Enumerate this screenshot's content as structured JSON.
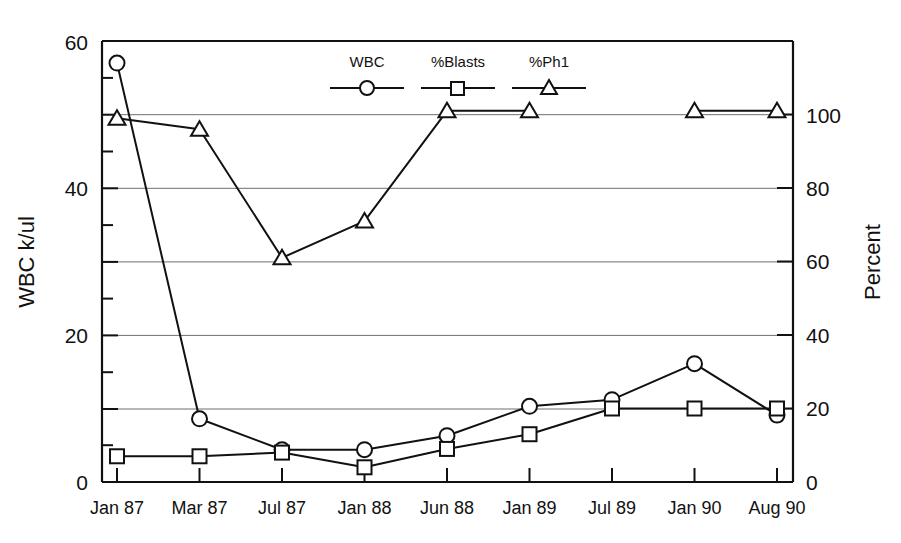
{
  "chart_data": {
    "type": "line",
    "title": "",
    "xlabel": "",
    "ylabel": "WBC k/ul",
    "y2label": "Percent",
    "categories": [
      "Jan 87",
      "Mar 87",
      "Jul 87",
      "Jan 88",
      "Jun 88",
      "Jan 89",
      "Jul 89",
      "Jan 90",
      "Aug 90"
    ],
    "ylim": [
      0,
      60
    ],
    "yticks": [
      0,
      20,
      40,
      60
    ],
    "yticks_minor": [
      10,
      30,
      50
    ],
    "y2lim": [
      0,
      120
    ],
    "y2ticks": [
      0,
      20,
      40,
      60,
      80,
      100
    ],
    "grid": true,
    "gridlines_at": [
      10,
      20,
      30,
      40,
      50
    ],
    "legend_position": "top-center-inside",
    "series": [
      {
        "name": "WBC",
        "marker": "circle",
        "axis": "left",
        "units": "k/ul",
        "values": [
          57,
          8.6,
          4.4,
          4.4,
          6.3,
          10.3,
          11.2,
          16.1,
          9.1
        ]
      },
      {
        "name": "%Blasts",
        "marker": "square",
        "axis": "right",
        "units": "percent",
        "values": [
          7,
          7,
          8,
          4,
          9,
          13,
          20,
          20,
          20
        ]
      },
      {
        "name": "%Ph1",
        "marker": "triangle",
        "axis": "right",
        "units": "percent",
        "values": [
          99,
          96,
          61,
          71,
          101,
          101,
          null,
          101,
          101
        ]
      }
    ]
  },
  "axes": {
    "left": {
      "title": "WBC k/ul",
      "tick_labels": [
        "0",
        "20",
        "40",
        "60"
      ]
    },
    "right": {
      "title": "Percent",
      "tick_labels": [
        "0",
        "20",
        "40",
        "60",
        "80",
        "100"
      ]
    },
    "bottom": {
      "tick_labels": [
        "Jan 87",
        "Mar 87",
        "Jul 87",
        "Jan 88",
        "Jun 88",
        "Jan 89",
        "Jul 89",
        "Jan 90",
        "Aug 90"
      ]
    }
  },
  "legend": {
    "entries": [
      {
        "label": "WBC",
        "marker": "circle-marker"
      },
      {
        "label": "%Blasts",
        "marker": "square-marker"
      },
      {
        "label": "%Ph1",
        "marker": "triangle-marker"
      }
    ]
  },
  "colors": {
    "ink": "#111111",
    "grid": "#6e6e6e",
    "background": "#ffffff",
    "marker_fill": "#ffffff"
  }
}
